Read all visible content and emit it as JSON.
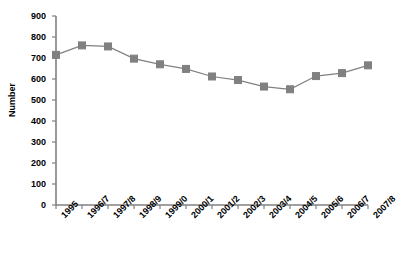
{
  "chart_data": {
    "type": "line",
    "title": "",
    "xlabel": "",
    "ylabel": "Number",
    "ylim": [
      0,
      900
    ],
    "ytick_step": 100,
    "yticks": [
      900,
      800,
      700,
      600,
      500,
      400,
      300,
      200,
      100,
      0
    ],
    "grid": false,
    "legend": "none",
    "marker": "square",
    "marker_color": "#808080",
    "line_color": "#808080",
    "axis_color": "#808080",
    "text_color": "#000000",
    "background": "#ffffff",
    "categories": [
      "1995",
      "1996/7",
      "1997/8",
      "1998/9",
      "1999/0",
      "2000/1",
      "2001/2",
      "2002/3",
      "2003/4",
      "2004/5",
      "2005/6",
      "2006/7",
      "2007/8"
    ],
    "values": [
      715,
      760,
      755,
      697,
      670,
      648,
      612,
      595,
      564,
      551,
      614,
      628,
      665
    ],
    "series": [
      {
        "name": "Number",
        "values": [
          715,
          760,
          755,
          697,
          670,
          648,
          612,
          595,
          564,
          551,
          614,
          628,
          665
        ]
      }
    ]
  }
}
